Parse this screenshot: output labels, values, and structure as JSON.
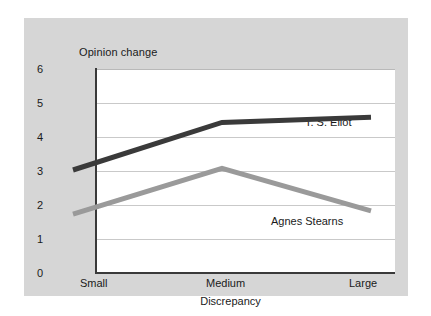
{
  "chart_data": {
    "type": "line",
    "title": "",
    "xlabel": "Discrepancy",
    "ylabel": "Opinion change",
    "categories": [
      "Small",
      "Medium",
      "Large"
    ],
    "ylim": [
      0,
      6
    ],
    "yticks": [
      "0",
      "1",
      "2",
      "3",
      "4",
      "5",
      "6"
    ],
    "grid": true,
    "legend_position": "inline-annotations",
    "series": [
      {
        "name": "T. S. Eliot",
        "color": "#3a3a3a",
        "values": [
          2.5,
          3.9,
          4.05
        ]
      },
      {
        "name": "Agnes Stearns",
        "color": "#9a9a9a",
        "values": [
          1.2,
          2.55,
          1.3
        ]
      }
    ],
    "annotations": [
      {
        "text": "T. S. Eliot",
        "series": "T. S. Eliot"
      },
      {
        "text": "Agnes Stearns",
        "series": "Agnes Stearns"
      }
    ]
  },
  "axes": {
    "y_title": "Opinion change",
    "x_title": "Discrepancy",
    "y_tick_6": "6",
    "y_tick_5": "5",
    "y_tick_4": "4",
    "y_tick_3": "3",
    "y_tick_2": "2",
    "y_tick_1": "1",
    "y_tick_0": "0",
    "x_tick_small": "Small",
    "x_tick_medium": "Medium",
    "x_tick_large": "Large"
  },
  "labels": {
    "eliot": "T. S. Eliot",
    "stearns": "Agnes Stearns"
  },
  "colors": {
    "panel_background": "#d6d6d6",
    "plot_background": "#ffffff",
    "axis": "#3a3a3a",
    "gridline": "#c9c9c9",
    "series_eliot": "#3a3a3a",
    "series_stearns": "#9a9a9a",
    "text": "#1a1a1a"
  }
}
